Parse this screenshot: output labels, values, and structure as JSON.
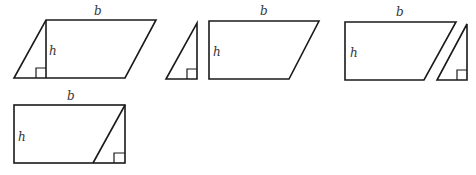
{
  "diagram": {
    "labels": {
      "base": "b",
      "height": "h"
    },
    "colors": {
      "stroke": "#1a1a1a",
      "label": "#333333",
      "background": "#ffffff"
    },
    "steps": [
      {
        "id": "step-1",
        "name": "parallelogram-with-height",
        "base_label": "b",
        "height_label": "h"
      },
      {
        "id": "step-2",
        "name": "cut-triangle-and-trapezoid",
        "base_label": "b",
        "height_label": "h"
      },
      {
        "id": "step-3",
        "name": "trapezoid-and-moved-triangle",
        "base_label": "b",
        "height_label": "h"
      },
      {
        "id": "step-4",
        "name": "rectangle-formed",
        "base_label": "b",
        "height_label": "h"
      }
    ]
  }
}
